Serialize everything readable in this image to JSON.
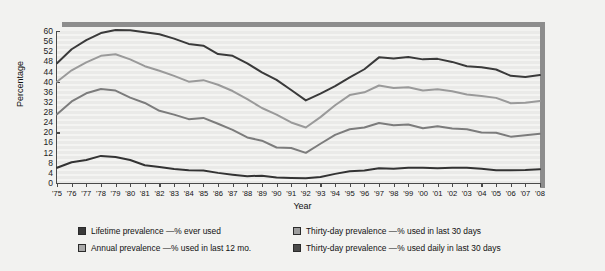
{
  "chart_data": {
    "type": "line",
    "title": "",
    "xlabel": "Year",
    "ylabel": "Percentage",
    "ylim": [
      0,
      60
    ],
    "ytick_step": 4,
    "yticks": [
      0,
      4,
      8,
      12,
      16,
      20,
      24,
      28,
      32,
      36,
      40,
      44,
      48,
      52,
      56,
      60
    ],
    "grid": true,
    "legend_position": "bottom",
    "x": [
      "'75",
      "'76",
      "'77",
      "'78",
      "'79",
      "'80",
      "'81",
      "'82",
      "'83",
      "'84",
      "'85",
      "'86",
      "'87",
      "'88",
      "'89",
      "'90",
      "'91",
      "'92",
      "'93",
      "'94",
      "'95",
      "'96",
      "'97",
      "'98",
      "'99",
      "'00",
      "'01",
      "'02",
      "'03",
      "'04",
      "'05",
      "'06",
      "'07",
      "'08"
    ],
    "categories": [
      "'75",
      "'76",
      "'77",
      "'78",
      "'79",
      "'80",
      "'81",
      "'82",
      "'83",
      "'84",
      "'85",
      "'86",
      "'87",
      "'88",
      "'89",
      "'90",
      "'91",
      "'92",
      "'93",
      "'94",
      "'95",
      "'96",
      "'97",
      "'98",
      "'99",
      "'00",
      "'01",
      "'02",
      "'03",
      "'04",
      "'05",
      "'06",
      "'07",
      "'08"
    ],
    "series": [
      {
        "name": "Lifetime prevalence —% ever used",
        "color": "#3a3a3a",
        "values": [
          47.3,
          52.8,
          56.4,
          59.2,
          60.4,
          60.3,
          59.5,
          58.7,
          57.0,
          54.9,
          54.2,
          50.9,
          50.2,
          47.2,
          43.7,
          40.7,
          36.7,
          32.6,
          35.3,
          38.2,
          41.7,
          44.9,
          49.6,
          49.1,
          49.7,
          48.8,
          49.0,
          47.8,
          46.1,
          45.7,
          44.8,
          42.3,
          41.8,
          42.6
        ]
      },
      {
        "name": "Annual prevalence —% used in last 12 mo.",
        "color": "#9a9a9a",
        "values": [
          40.0,
          44.5,
          47.6,
          50.2,
          50.8,
          48.8,
          46.1,
          44.3,
          42.3,
          40.0,
          40.6,
          38.8,
          36.3,
          33.1,
          29.6,
          27.0,
          23.9,
          21.9,
          26.0,
          30.7,
          34.7,
          35.8,
          38.5,
          37.5,
          37.8,
          36.5,
          37.0,
          36.2,
          34.9,
          34.3,
          33.6,
          31.5,
          31.7,
          32.4
        ]
      },
      {
        "name": "Thirty-day prevalence —% used in last 30 days",
        "color": "#7c7c7c",
        "values": [
          27.1,
          32.2,
          35.4,
          37.1,
          36.5,
          33.7,
          31.6,
          28.5,
          27.0,
          25.2,
          25.7,
          23.4,
          21.0,
          18.0,
          16.7,
          14.0,
          13.8,
          11.9,
          15.5,
          19.0,
          21.2,
          21.9,
          23.7,
          22.8,
          23.1,
          21.6,
          22.4,
          21.5,
          21.2,
          19.9,
          19.8,
          18.3,
          18.8,
          19.4
        ]
      },
      {
        "name": "Thirty-day prevalence —% used daily in last 30 days",
        "color": "#333333",
        "values": [
          6.0,
          8.2,
          9.1,
          10.7,
          10.3,
          9.1,
          7.0,
          6.3,
          5.5,
          5.0,
          4.9,
          4.0,
          3.3,
          2.7,
          2.9,
          2.2,
          2.0,
          1.9,
          2.4,
          3.6,
          4.6,
          4.9,
          5.8,
          5.6,
          6.0,
          6.0,
          5.8,
          6.0,
          6.0,
          5.6,
          5.0,
          5.0,
          5.1,
          5.4
        ]
      }
    ]
  },
  "axis": {
    "y_title": "Percentage",
    "x_title": "Year"
  },
  "legend": {
    "items": [
      {
        "label": "Lifetime prevalence —% ever used",
        "color": "#3a3a3a"
      },
      {
        "label": "Thirty-day prevalence —% used in last 30 days",
        "color": "#9d9d9d"
      },
      {
        "label": "Annual prevalence —% used in last 12 mo.",
        "color": "#a9a9a9"
      },
      {
        "label": "Thirty-day prevalence —% used daily in last 30 days",
        "color": "#4a4a4a"
      }
    ]
  },
  "colors": {
    "figure_background": "#f2f2f0",
    "plot_background": "#ededeb",
    "rule": "#8d8d8d",
    "axis": "#4a4a4a",
    "text": "#111111"
  }
}
